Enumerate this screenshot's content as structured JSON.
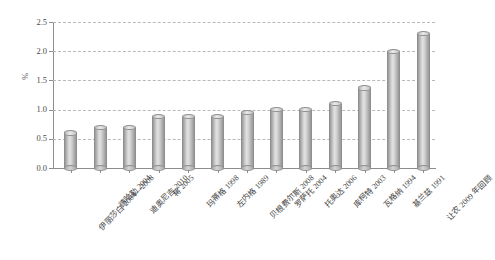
{
  "chart_data": {
    "type": "bar",
    "title": "",
    "xlabel": "",
    "ylabel": "%",
    "ylim": [
      0.0,
      2.5
    ],
    "ytick_labels": [
      "0.0",
      "0.5",
      "1.0",
      "1.5",
      "2.0",
      "2.5"
    ],
    "ytick_values": [
      0.0,
      0.5,
      1.0,
      1.5,
      2.0,
      2.5
    ],
    "grid": true,
    "legend": "none",
    "categories": [
      "伊丽莎白 2004—2008",
      "德哈勒 2004",
      "迪奥尼吉 2010",
      "蒋 2005",
      "玛蒂格 1998",
      "左内格 1989",
      "贝根费尔斯 2008",
      "罗萨托 2004",
      "托奥达 2006",
      "库柯特 2003",
      "瓦格纳 1994",
      "基兰兹 1991",
      "让农 2009 年回顾"
    ],
    "values": [
      0.6,
      0.7,
      0.7,
      0.88,
      0.88,
      0.88,
      0.95,
      1.0,
      1.0,
      1.1,
      1.37,
      2.0,
      2.3
    ],
    "bar_color": "#cfcfcf",
    "grid_color": "#b9b9b9",
    "axis_color": "#8d8d8d"
  }
}
